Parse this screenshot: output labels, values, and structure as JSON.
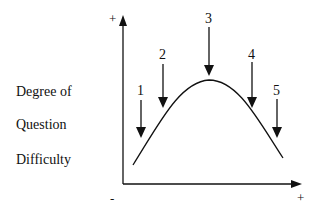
{
  "diagram": {
    "y_axis_label_lines": [
      "Degree of",
      "Question",
      "Difficulty"
    ],
    "y_axis_plus": "+",
    "x_axis_minus": "-",
    "x_axis_plus": "+",
    "arrows": [
      {
        "label": "1",
        "x": 141,
        "label_y": 95,
        "top": 101,
        "tip": 138
      },
      {
        "label": "2",
        "x": 163,
        "label_y": 59,
        "top": 64,
        "tip": 108
      },
      {
        "label": "3",
        "x": 209,
        "label_y": 23,
        "top": 28,
        "tip": 76
      },
      {
        "label": "4",
        "x": 252,
        "label_y": 59,
        "top": 64,
        "tip": 108
      },
      {
        "label": "5",
        "x": 277,
        "label_y": 95,
        "top": 101,
        "tip": 138
      }
    ],
    "curve": {
      "start": [
        133,
        165
      ],
      "peak": [
        209,
        80
      ],
      "end": [
        283,
        158
      ]
    },
    "colors": {
      "line": "#111111",
      "background": "#ffffff"
    }
  }
}
